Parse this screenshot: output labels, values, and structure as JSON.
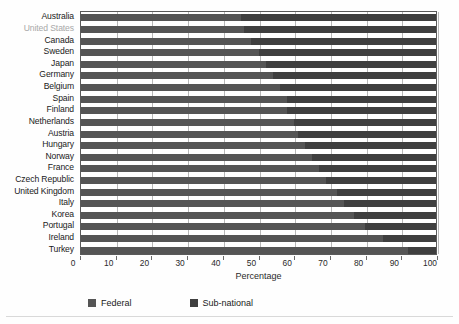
{
  "chart_data": {
    "type": "bar",
    "title": "",
    "subtitle": "",
    "xlabel": "Percentage",
    "ylabel": "",
    "orientation": "horizontal",
    "stacked": true,
    "stack_total": 100,
    "xlim": [
      0,
      100
    ],
    "xticks": [
      0,
      10,
      20,
      30,
      40,
      50,
      60,
      70,
      80,
      90,
      100
    ],
    "xtick_labels": [
      "0",
      "10",
      "20",
      "30",
      "40",
      "50",
      "60",
      "70",
      "80",
      "90",
      "100"
    ],
    "grid": true,
    "grid_axis": "x",
    "legend_position": "bottom",
    "legend": [
      "Federal",
      "Sub-national"
    ],
    "categories": [
      "Australia",
      "United States",
      "Canada",
      "Sweden",
      "Japan",
      "Germany",
      "Belgium",
      "Spain",
      "Finland",
      "Netherlands",
      "Austria",
      "Hungary",
      "Norway",
      "France",
      "Czech Republic",
      "United Kingdom",
      "Italy",
      "Korea",
      "Portugal",
      "Ireland",
      "Turkey"
    ],
    "highlighted_category": "United States",
    "series": [
      {
        "name": "Federal",
        "color": "#555555",
        "values": [
          45,
          46,
          48,
          50,
          52,
          54,
          56,
          58,
          58,
          60,
          61,
          63,
          65,
          67,
          69,
          72,
          74,
          77,
          80,
          85,
          92
        ]
      },
      {
        "name": "Sub-national",
        "color": "#3f3f3f",
        "values": [
          55,
          54,
          52,
          50,
          48,
          46,
          44,
          42,
          42,
          40,
          39,
          37,
          35,
          33,
          31,
          28,
          26,
          23,
          20,
          15,
          8
        ]
      }
    ]
  },
  "colors": {
    "federal": "#555555",
    "subnational": "#3f3f3f",
    "gridline": "#b8b8b8",
    "axis": "#5a5a5a",
    "label": "#1a1a1a",
    "label_highlight": "#a8a8a8"
  }
}
